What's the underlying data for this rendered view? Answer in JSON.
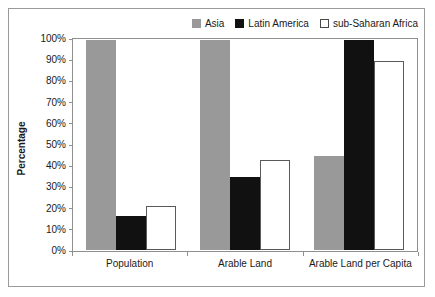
{
  "chart_data": {
    "type": "bar",
    "title": "",
    "xlabel": "",
    "ylabel": "Percentage",
    "ylim": [
      0,
      100
    ],
    "grid": false,
    "legend_position": "top-right",
    "categories": [
      "Population",
      "Arable Land",
      "Arable Land per Capita"
    ],
    "y_ticks": [
      "0%",
      "10%",
      "20%",
      "30%",
      "40%",
      "50%",
      "60%",
      "70%",
      "80%",
      "90%",
      "100%"
    ],
    "y_tick_values": [
      0,
      10,
      20,
      30,
      40,
      50,
      60,
      70,
      80,
      90,
      100
    ],
    "series": [
      {
        "name": "Asia",
        "color": "#999999",
        "swatch_style": "filled",
        "values": [
          100,
          100,
          45
        ]
      },
      {
        "name": "Latin America",
        "color": "#111111",
        "swatch_style": "filled",
        "values": [
          16,
          35,
          100
        ]
      },
      {
        "name": "sub-Saharan Africa",
        "color": "#ffffff",
        "swatch_style": "outlined",
        "values": [
          21,
          43,
          90
        ]
      }
    ]
  }
}
